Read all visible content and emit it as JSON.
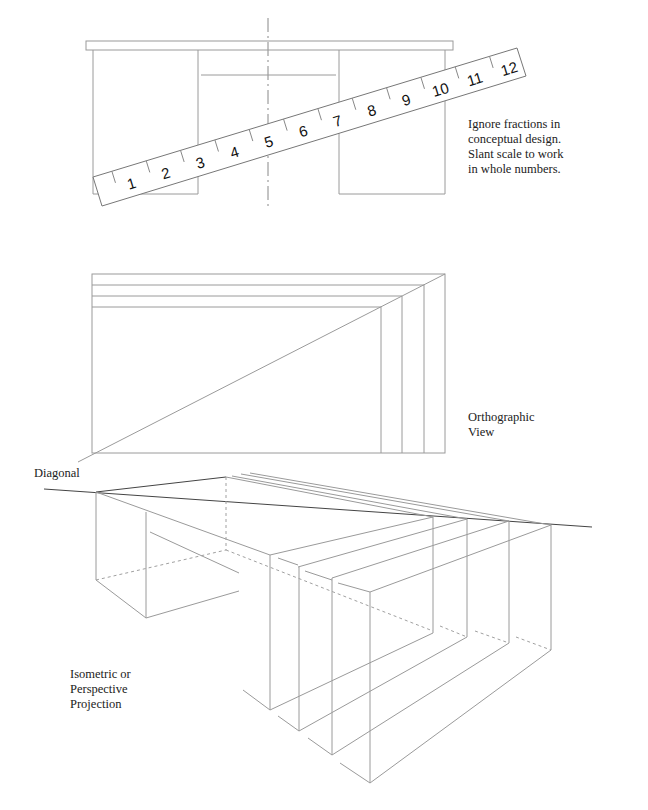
{
  "figure": {
    "ruler": {
      "numbers": [
        "1",
        "2",
        "3",
        "4",
        "5",
        "6",
        "7",
        "8",
        "9",
        "10",
        "11",
        "12"
      ]
    },
    "notes": {
      "scale_note": [
        "Ignore fractions in",
        "conceptual design.",
        "Slant scale to work",
        "in whole numbers."
      ],
      "orthographic_label": [
        "Orthographic",
        "View"
      ],
      "diagonal_label": "Diagonal",
      "projection_label": [
        "Isometric or",
        "Perspective",
        "Projection"
      ]
    },
    "colors": {
      "line": "#9a9a9a",
      "dark_line": "#444444",
      "text": "#222222",
      "background": "#ffffff"
    }
  }
}
